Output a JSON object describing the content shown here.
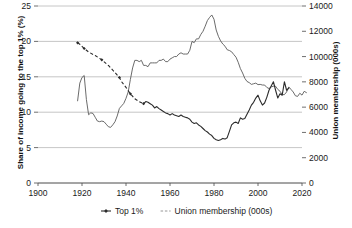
{
  "chart_data": {
    "type": "line",
    "title": "",
    "xlabel": "",
    "xlim": [
      1900,
      2020
    ],
    "xticks": [
      1900,
      1920,
      1940,
      1960,
      1980,
      2000,
      2020
    ],
    "grid": true,
    "legend_position": "bottom",
    "axes": [
      {
        "id": "left",
        "label": "Share of income going to the top 1% (%)",
        "lim": [
          0,
          25
        ],
        "ticks": [
          0,
          5,
          10,
          15,
          20,
          25
        ]
      },
      {
        "id": "right",
        "label": "Union membership (000s)",
        "lim": [
          0,
          14000
        ],
        "ticks": [
          0,
          2000,
          4000,
          6000,
          8000,
          10000,
          12000,
          14000
        ]
      }
    ],
    "series": [
      {
        "name": "Top 1%",
        "axis": "left",
        "style": "dashed-then-solid",
        "marker": "diamond",
        "color": "#2b2b2b",
        "points": [
          [
            1918,
            19.8
          ],
          [
            1919,
            19.6
          ],
          [
            1920,
            19.3
          ],
          [
            1921,
            19.0
          ],
          [
            1923,
            18.5
          ],
          [
            1926,
            18.0
          ],
          [
            1929,
            17.4
          ],
          [
            1932,
            16.6
          ],
          [
            1935,
            15.6
          ],
          [
            1937,
            14.9
          ],
          [
            1938,
            14.3
          ],
          [
            1940,
            13.5
          ],
          [
            1942,
            12.6
          ],
          [
            1944,
            11.9
          ],
          [
            1946,
            11.5
          ],
          [
            1948,
            11.2
          ],
          [
            1949,
            11.5
          ],
          [
            1950,
            11.4
          ],
          [
            1951,
            11.2
          ],
          [
            1952,
            11.0
          ],
          [
            1953,
            10.6
          ],
          [
            1954,
            10.8
          ],
          [
            1955,
            10.5
          ],
          [
            1956,
            10.3
          ],
          [
            1957,
            10.1
          ],
          [
            1958,
            9.9
          ],
          [
            1959,
            9.8
          ],
          [
            1960,
            9.6
          ],
          [
            1961,
            9.8
          ],
          [
            1962,
            9.6
          ],
          [
            1963,
            9.5
          ],
          [
            1964,
            9.4
          ],
          [
            1965,
            9.6
          ],
          [
            1966,
            9.4
          ],
          [
            1967,
            9.3
          ],
          [
            1968,
            9.2
          ],
          [
            1969,
            9.0
          ],
          [
            1970,
            8.6
          ],
          [
            1971,
            8.4
          ],
          [
            1972,
            8.5
          ],
          [
            1973,
            8.2
          ],
          [
            1974,
            8.0
          ],
          [
            1975,
            7.7
          ],
          [
            1976,
            7.4
          ],
          [
            1977,
            7.2
          ],
          [
            1978,
            6.9
          ],
          [
            1979,
            6.7
          ],
          [
            1980,
            6.3
          ],
          [
            1981,
            6.1
          ],
          [
            1982,
            6.0
          ],
          [
            1983,
            6.1
          ],
          [
            1984,
            6.3
          ],
          [
            1985,
            6.2
          ],
          [
            1986,
            6.4
          ],
          [
            1987,
            7.3
          ],
          [
            1988,
            8.2
          ],
          [
            1989,
            8.5
          ],
          [
            1990,
            8.6
          ],
          [
            1991,
            8.4
          ],
          [
            1992,
            9.2
          ],
          [
            1993,
            9.0
          ],
          [
            1994,
            9.1
          ],
          [
            1995,
            9.7
          ],
          [
            1996,
            10.3
          ],
          [
            1997,
            11.0
          ],
          [
            1998,
            11.4
          ],
          [
            1999,
            12.0
          ],
          [
            2000,
            12.4
          ],
          [
            2001,
            11.6
          ],
          [
            2002,
            11.0
          ],
          [
            2003,
            11.3
          ],
          [
            2004,
            12.1
          ],
          [
            2005,
            13.1
          ],
          [
            2006,
            13.7
          ],
          [
            2007,
            14.3
          ],
          [
            2008,
            13.1
          ],
          [
            2009,
            12.0
          ],
          [
            2010,
            12.6
          ],
          [
            2011,
            12.4
          ],
          [
            2012,
            14.3
          ],
          [
            2013,
            13.1
          ],
          [
            2014,
            13.4
          ]
        ]
      },
      {
        "name": "Union membership (000s)",
        "axis": "right",
        "style": "solid-thin",
        "marker": "none",
        "color": "#5a5a5a",
        "points": [
          [
            1918,
            6500
          ],
          [
            1919,
            7900
          ],
          [
            1920,
            8350
          ],
          [
            1921,
            8500
          ],
          [
            1922,
            6600
          ],
          [
            1923,
            5400
          ],
          [
            1924,
            5550
          ],
          [
            1925,
            5500
          ],
          [
            1926,
            5200
          ],
          [
            1927,
            4900
          ],
          [
            1928,
            4850
          ],
          [
            1929,
            4900
          ],
          [
            1930,
            4850
          ],
          [
            1931,
            4650
          ],
          [
            1932,
            4450
          ],
          [
            1933,
            4400
          ],
          [
            1934,
            4600
          ],
          [
            1935,
            4850
          ],
          [
            1936,
            5300
          ],
          [
            1937,
            5900
          ],
          [
            1938,
            6100
          ],
          [
            1939,
            6300
          ],
          [
            1940,
            6700
          ],
          [
            1941,
            7200
          ],
          [
            1942,
            8200
          ],
          [
            1943,
            9100
          ],
          [
            1944,
            9700
          ],
          [
            1945,
            9700
          ],
          [
            1946,
            9600
          ],
          [
            1947,
            9700
          ],
          [
            1948,
            9300
          ],
          [
            1949,
            9300
          ],
          [
            1950,
            9200
          ],
          [
            1951,
            9500
          ],
          [
            1952,
            9500
          ],
          [
            1953,
            9500
          ],
          [
            1954,
            9500
          ],
          [
            1955,
            9700
          ],
          [
            1956,
            9700
          ],
          [
            1957,
            9800
          ],
          [
            1958,
            9600
          ],
          [
            1959,
            9600
          ],
          [
            1960,
            9800
          ],
          [
            1961,
            9900
          ],
          [
            1962,
            10000
          ],
          [
            1963,
            10000
          ],
          [
            1964,
            10200
          ],
          [
            1965,
            10300
          ],
          [
            1966,
            10200
          ],
          [
            1967,
            10200
          ],
          [
            1968,
            10200
          ],
          [
            1969,
            10500
          ],
          [
            1970,
            11200
          ],
          [
            1971,
            11100
          ],
          [
            1972,
            11400
          ],
          [
            1973,
            11400
          ],
          [
            1974,
            11750
          ],
          [
            1975,
            12000
          ],
          [
            1976,
            12400
          ],
          [
            1977,
            12850
          ],
          [
            1978,
            13100
          ],
          [
            1979,
            13290
          ],
          [
            1980,
            12950
          ],
          [
            1981,
            12100
          ],
          [
            1982,
            11600
          ],
          [
            1983,
            11240
          ],
          [
            1984,
            10990
          ],
          [
            1985,
            10820
          ],
          [
            1986,
            10540
          ],
          [
            1987,
            10480
          ],
          [
            1988,
            10380
          ],
          [
            1989,
            10160
          ],
          [
            1990,
            9950
          ],
          [
            1991,
            9550
          ],
          [
            1992,
            9050
          ],
          [
            1993,
            8700
          ],
          [
            1994,
            8280
          ],
          [
            1995,
            8030
          ],
          [
            1996,
            7940
          ],
          [
            1997,
            7800
          ],
          [
            1998,
            7850
          ],
          [
            1999,
            7900
          ],
          [
            2000,
            7780
          ],
          [
            2001,
            7800
          ],
          [
            2002,
            7750
          ],
          [
            2003,
            7750
          ],
          [
            2004,
            7560
          ],
          [
            2005,
            7470
          ],
          [
            2006,
            7600
          ],
          [
            2007,
            7650
          ],
          [
            2008,
            7650
          ],
          [
            2009,
            7400
          ],
          [
            2010,
            7260
          ],
          [
            2011,
            6990
          ],
          [
            2012,
            6990
          ],
          [
            2013,
            7200
          ],
          [
            2014,
            7600
          ],
          [
            2015,
            7400
          ],
          [
            2016,
            7200
          ],
          [
            2017,
            6900
          ],
          [
            2018,
            6850
          ],
          [
            2019,
            7100
          ],
          [
            2020,
            6950
          ],
          [
            2021,
            7250
          ],
          [
            2022,
            7150
          ]
        ]
      }
    ],
    "legend": [
      {
        "label": "Top 1%",
        "marker": "diamond-dark",
        "color": "#2b2b2b"
      },
      {
        "label": "Union membership (000s)",
        "marker": "line-light",
        "color": "#777777"
      }
    ]
  },
  "colors": {
    "grid": "#b8b8b8",
    "axis": "#4a4a4a",
    "top1": "#2b2b2b",
    "union": "#5a5a5a",
    "text": "#1a1a1a",
    "background": "#ffffff"
  }
}
